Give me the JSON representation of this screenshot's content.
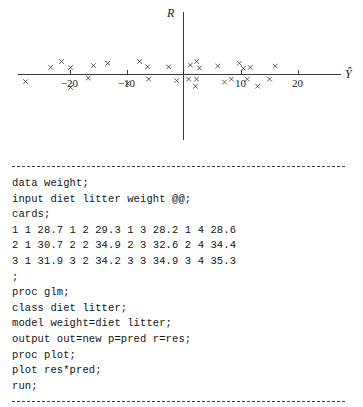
{
  "chart_data": {
    "type": "scatter",
    "title": "",
    "xlabel": "Ŷ",
    "ylabel": "R",
    "xlim": [
      -32,
      27
    ],
    "ylim": [
      -7.5,
      7.5
    ],
    "grid": false,
    "legend": null,
    "x_ticks": [
      -20,
      -10,
      10,
      20
    ],
    "x_tick_labels": [
      "−20",
      "−10",
      "10",
      "20"
    ],
    "y_ticks": [],
    "y_tick_labels": [],
    "marker": "x",
    "points": [
      {
        "x": -27.7,
        "y": -2.8
      },
      {
        "x": -23.3,
        "y": 2.8
      },
      {
        "x": -21.4,
        "y": 5.1
      },
      {
        "x": -19.8,
        "y": 2.8
      },
      {
        "x": -19.8,
        "y": -5.1
      },
      {
        "x": -16.7,
        "y": -1.4
      },
      {
        "x": -15.8,
        "y": 3.5
      },
      {
        "x": -13.3,
        "y": 4.4
      },
      {
        "x": -9.8,
        "y": -3.5
      },
      {
        "x": -7.7,
        "y": 5.1
      },
      {
        "x": -6.3,
        "y": 3.0
      },
      {
        "x": -6.1,
        "y": -1.8
      },
      {
        "x": -2.6,
        "y": 3.0
      },
      {
        "x": -1.2,
        "y": -2.4
      },
      {
        "x": 0.9,
        "y": -1.8
      },
      {
        "x": 1.2,
        "y": 3.7
      },
      {
        "x": 2.1,
        "y": -4.6
      },
      {
        "x": 2.3,
        "y": 5.1
      },
      {
        "x": 2.3,
        "y": -1.8
      },
      {
        "x": 2.8,
        "y": 2.6
      },
      {
        "x": 6.0,
        "y": 3.3
      },
      {
        "x": 7.2,
        "y": -3.0
      },
      {
        "x": 8.4,
        "y": -1.8
      },
      {
        "x": 9.8,
        "y": 4.4
      },
      {
        "x": 10.5,
        "y": 2.4
      },
      {
        "x": 11.2,
        "y": -1.8
      },
      {
        "x": 11.7,
        "y": 2.8
      },
      {
        "x": 13.0,
        "y": -4.6
      },
      {
        "x": 15.1,
        "y": -1.8
      },
      {
        "x": 16.1,
        "y": 3.3
      }
    ]
  },
  "code": {
    "language": "SAS",
    "lines": [
      "data weight;",
      "input diet litter weight @@;",
      "cards;",
      "1 1 28.7 1 2 29.3 1 3 28.2 1 4 28.6",
      "2 1 30.7 2 2 34.9 2 3 32.6 2 4 34.4",
      "3 1 31.9 3 2 34.2 3 3 34.9 3 4 35.3",
      ";",
      "proc glm;",
      "class diet litter;",
      "model weight=diet litter;",
      "output out=new p=pred r=res;",
      "proc plot;",
      "plot res*pred;",
      "run;"
    ]
  }
}
